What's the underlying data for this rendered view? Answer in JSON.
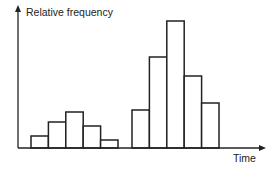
{
  "chart_data": {
    "type": "bar",
    "title": "",
    "xlabel": "Time",
    "ylabel": "Relative frequency",
    "grid": false,
    "legend": null,
    "tick_labels": false,
    "categories": [
      "1",
      "2",
      "3",
      "4",
      "5",
      "6",
      "7",
      "8",
      "9",
      "10"
    ],
    "groups": [
      {
        "name": "group-1",
        "values": [
          12,
          26,
          36,
          22,
          8
        ]
      },
      {
        "name": "group-2",
        "values": [
          38,
          91,
          127,
          72,
          45
        ]
      }
    ],
    "values": [
      12,
      26,
      36,
      22,
      8,
      38,
      91,
      127,
      72,
      45
    ],
    "ylim": [
      0,
      140
    ]
  },
  "labels": {
    "y_axis": "Relative frequency",
    "x_axis": "Time"
  },
  "colors": {
    "stroke": "#222222",
    "fill": "#ffffff"
  }
}
